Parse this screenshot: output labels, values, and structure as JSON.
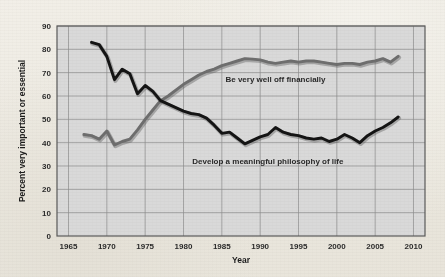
{
  "chart_data": {
    "type": "line",
    "title": "",
    "xlabel": "Year",
    "ylabel": "Percent very important or essential",
    "xlim": [
      1963.5,
      2011.5
    ],
    "ylim": [
      0,
      90
    ],
    "xticks": [
      1965,
      1970,
      1975,
      1980,
      1985,
      1990,
      1995,
      2000,
      2005,
      2010
    ],
    "yticks": [
      0,
      10,
      20,
      30,
      40,
      50,
      60,
      70,
      80,
      90
    ],
    "grid": true,
    "legend_position": "inline-annotation",
    "plot_background": "#d9d9d9",
    "page_background": "#efece4",
    "series": [
      {
        "name": "Be very well off financially",
        "color": "#6e6e6e",
        "label_x": 1992,
        "label_y": 66,
        "x": [
          1967,
          1968,
          1969,
          1970,
          1971,
          1972,
          1973,
          1974,
          1975,
          1976,
          1977,
          1978,
          1979,
          1980,
          1981,
          1982,
          1983,
          1984,
          1985,
          1986,
          1987,
          1988,
          1989,
          1990,
          1991,
          1992,
          1993,
          1994,
          1995,
          1996,
          1997,
          1998,
          1999,
          2000,
          2001,
          2002,
          2003,
          2004,
          2005,
          2006,
          2007,
          2008
        ],
        "y": [
          43.5,
          43.0,
          41.5,
          45.0,
          39.0,
          40.5,
          41.5,
          45.5,
          50.0,
          54.0,
          58.0,
          60.0,
          62.5,
          65.0,
          67.0,
          69.0,
          70.5,
          71.5,
          73.0,
          74.0,
          75.0,
          76.0,
          75.8,
          75.5,
          74.5,
          74.0,
          74.5,
          75.0,
          74.5,
          75.0,
          75.0,
          74.5,
          74.0,
          73.5,
          74.0,
          74.0,
          73.5,
          74.5,
          75.0,
          76.0,
          74.5,
          77.0
        ]
      },
      {
        "name": "Develop a meaningful philosophy of life",
        "color": "#141414",
        "label_x": 1991,
        "label_y": 31,
        "x": [
          1968,
          1969,
          1970,
          1971,
          1972,
          1973,
          1974,
          1975,
          1976,
          1977,
          1978,
          1979,
          1980,
          1981,
          1982,
          1983,
          1984,
          1985,
          1986,
          1987,
          1988,
          1989,
          1990,
          1991,
          1992,
          1993,
          1994,
          1995,
          1996,
          1997,
          1998,
          1999,
          2000,
          2001,
          2002,
          2003,
          2004,
          2005,
          2006,
          2007,
          2008
        ],
        "y": [
          83.0,
          82.0,
          77.0,
          67.0,
          71.5,
          69.5,
          61.0,
          64.5,
          62.0,
          58.0,
          56.5,
          55.0,
          53.5,
          52.5,
          52.0,
          50.5,
          47.5,
          44.0,
          44.5,
          42.0,
          39.5,
          41.0,
          42.5,
          43.5,
          46.5,
          44.5,
          43.5,
          43.0,
          42.0,
          41.5,
          42.0,
          40.5,
          41.5,
          43.5,
          42.0,
          40.0,
          43.0,
          45.0,
          46.5,
          48.5,
          51.0
        ]
      }
    ]
  }
}
